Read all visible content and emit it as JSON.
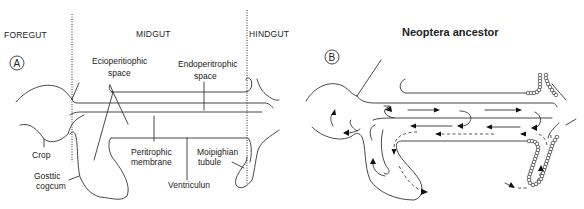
{
  "panel_a": {
    "marker": "A",
    "regions": {
      "foregut": "FOREGUT",
      "midgut": "MIDGUT",
      "hindgut": "HINDGUT"
    },
    "labels": {
      "ectoperitrophic_line1": "Ecioperitiophic",
      "ectoperitrophic_line2": "space",
      "endoperitrophic_line1": "Endoperitrophic",
      "endoperitrophic_line2": "space",
      "crop": "Crop",
      "gastric_line1": "Gosttic",
      "gastric_line2": "cogcum",
      "peritrophic_line1": "Peritrophic",
      "peritrophic_line2": "membrane",
      "malpighian_line1": "Moipighian",
      "malpighian_line2": "tubule",
      "ventriculus": "Ventriculun"
    }
  },
  "panel_b": {
    "marker": "B",
    "title": "Neoptera ancestor"
  },
  "colors": {
    "ink": "#333333",
    "background": "#ffffff"
  }
}
